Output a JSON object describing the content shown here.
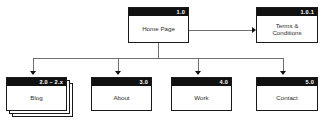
{
  "diagram": {
    "colors": {
      "header_bar": "#111111",
      "header_text": "#ffffff",
      "box_border": "#1a1a1a",
      "box_fill": "#ffffff",
      "connector": "#6f6f6f",
      "arrow": "#111111",
      "body_text": "#2b2b2b"
    },
    "nodes": {
      "home": {
        "number": "1.0",
        "label": "Home Page"
      },
      "terms": {
        "number": "1.0.1",
        "label_line1": "Terms &",
        "label_line2": "Conditions"
      },
      "blog": {
        "number": "2.0 – 2.x",
        "label": "Blog",
        "stacked": "true"
      },
      "about": {
        "number": "3.0",
        "label": "About"
      },
      "work": {
        "number": "4.0",
        "label": "Work"
      },
      "contact": {
        "number": "5.0",
        "label": "Contact"
      }
    }
  }
}
